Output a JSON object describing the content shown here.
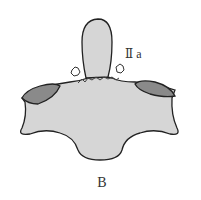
{
  "diagram": {
    "type_label": "Ⅱ a",
    "panel_label": "B",
    "colors": {
      "body_fill": "#d6d6d6",
      "facet_fill": "#8a8a8a",
      "outline": "#222222"
    }
  }
}
